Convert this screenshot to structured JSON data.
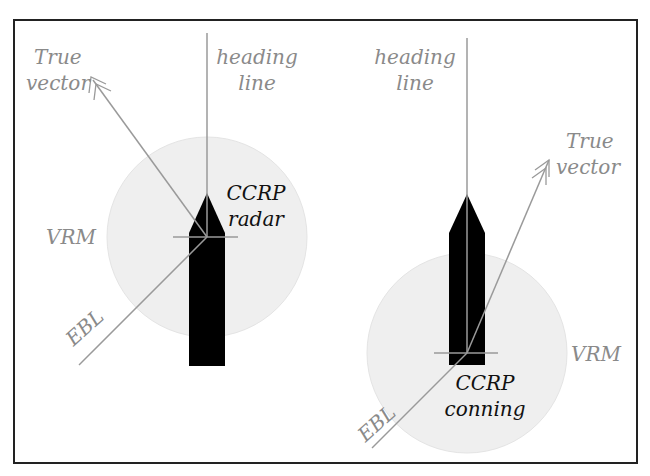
{
  "figure": {
    "colors": {
      "frame": "#222222",
      "ship": "#000000",
      "line": "#9a9a9a",
      "circle_fill": "#eeeeee",
      "label_grey": "#8a8a8a",
      "label_dark": "#111111"
    }
  },
  "left_panel": {
    "true_vector_line1": "True",
    "true_vector_line2": "vector",
    "heading_line1": "heading",
    "heading_line2": "line",
    "ccrp_line1": "CCRP",
    "ccrp_line2": "radar",
    "vrm": "VRM",
    "ebl": "EBL"
  },
  "right_panel": {
    "heading_line1": "heading",
    "heading_line2": "line",
    "true_vector_line1": "True",
    "true_vector_line2": "vector",
    "ccrp_line1": "CCRP",
    "ccrp_line2": "conning",
    "vrm": "VRM",
    "ebl": "EBL"
  }
}
